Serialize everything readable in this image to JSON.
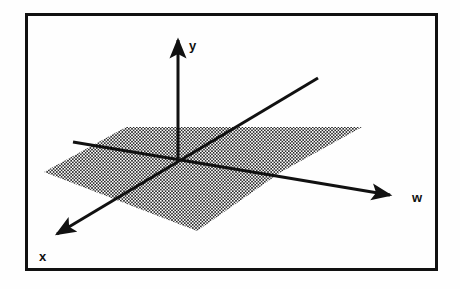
{
  "figure": {
    "background_color": "#fefefe",
    "stroke_color": "#111111",
    "frame": {
      "name": "figure-border",
      "x": 25,
      "y": 13,
      "width": 413,
      "height": 258,
      "stroke_width": 3,
      "fill": "none"
    },
    "plane": {
      "name": "shaded-plane",
      "description": "Dotted/stippled parallelogram representing the x-w plane",
      "fill_pattern": "halftone-dots",
      "dot_color": "#2b2b2b",
      "dot_spacing_px": 3.2,
      "vertices": [
        {
          "x": 44,
          "y": 172
        },
        {
          "x": 126,
          "y": 127
        },
        {
          "x": 362,
          "y": 127
        },
        {
          "x": 281,
          "y": 172
        },
        {
          "x": 197,
          "y": 231
        },
        {
          "x": 108,
          "y": 184
        }
      ],
      "outline_points": "44,172 126,127 362,127 281,172 197,231"
    },
    "origin": {
      "x": 178,
      "y": 158
    },
    "axes": [
      {
        "id": "y-axis",
        "label": "y",
        "name": "axis-y",
        "line_from": {
          "x": 178,
          "y": 158
        },
        "line_to": {
          "x": 178,
          "y": 40
        },
        "arrow_at": {
          "x": 178,
          "y": 31
        },
        "arrow": true,
        "stroke_width": 3,
        "label_position": {
          "x": 189,
          "y": 50
        },
        "direction": "up"
      },
      {
        "id": "w-axis",
        "label": "w",
        "name": "axis-w",
        "line_from": {
          "x": 73,
          "y": 142
        },
        "line_to": {
          "x": 390,
          "y": 195
        },
        "arrow_at": {
          "x": 401,
          "y": 197
        },
        "arrow": true,
        "stroke_width": 3,
        "label_position": {
          "x": 412,
          "y": 202
        },
        "direction": "right-down"
      },
      {
        "id": "x-axis",
        "label": "x",
        "name": "axis-x",
        "line_from": {
          "x": 318,
          "y": 78
        },
        "line_to": {
          "x": 57,
          "y": 234
        },
        "arrow_at": {
          "x": 47,
          "y": 240
        },
        "arrow": true,
        "stroke_width": 3,
        "label_position": {
          "x": 39,
          "y": 261
        },
        "direction": "left-down"
      }
    ],
    "labels": {
      "y": "y",
      "w": "w",
      "x": "x"
    }
  }
}
